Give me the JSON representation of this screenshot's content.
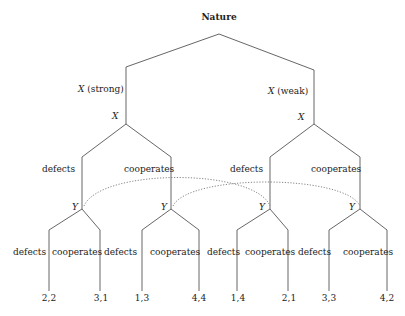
{
  "root": {
    "label": "Nature"
  },
  "branches": {
    "strong": {
      "label_player": "X",
      "label_type": "(strong)"
    },
    "weak": {
      "label_player": "X",
      "label_type": "(weak)"
    }
  },
  "player_nodes": {
    "x_left": "X",
    "x_right": "X",
    "y1": "Y",
    "y2": "Y",
    "y3": "Y",
    "y4": "Y"
  },
  "x_actions": [
    "defects",
    "cooperates",
    "defects",
    "cooperates"
  ],
  "y_actions": [
    "defects",
    "cooperates",
    "defects",
    "cooperates",
    "defects",
    "cooperates",
    "defects",
    "cooperates"
  ],
  "payoffs": [
    "2,2",
    "3,1",
    "1,3",
    "4,4",
    "1,4",
    "2,1",
    "3,3",
    "4,2"
  ],
  "information_sets": [
    {
      "description": "Y after X defects",
      "nodes": [
        "y1",
        "y3"
      ]
    },
    {
      "description": "Y after X cooperates",
      "nodes": [
        "y2",
        "y4"
      ]
    }
  ],
  "colors": {
    "line": "#555555",
    "text": "#222222",
    "dotted": "#666666"
  }
}
